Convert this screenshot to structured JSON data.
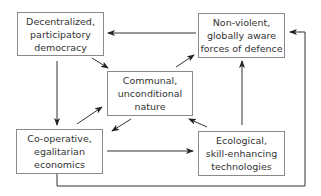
{
  "nodes": {
    "democracy": {
      "label": "Decentralized,\nparticipatory\ndemocracy"
    },
    "defence": {
      "label": "Non-violent,\nglobally aware\nforces of defence"
    },
    "nature": {
      "label": "Communal,\nunconditional\nnature"
    },
    "economics": {
      "label": "Co-operative,\negalitarian\neconomics"
    },
    "technologies": {
      "label": "Ecological,\nskill-enhancing\ntechnologies"
    }
  },
  "edges": [
    {
      "from": "defence",
      "to": "democracy"
    },
    {
      "from": "democracy",
      "to": "nature"
    },
    {
      "from": "nature",
      "to": "defence"
    },
    {
      "from": "democracy",
      "to": "economics"
    },
    {
      "from": "economics",
      "to": "nature"
    },
    {
      "from": "nature",
      "to": "economics"
    },
    {
      "from": "technologies",
      "to": "nature"
    },
    {
      "from": "economics",
      "to": "technologies"
    },
    {
      "from": "technologies",
      "to": "defence"
    },
    {
      "from": "economics",
      "to": "defence",
      "route": "bottom-right loop"
    }
  ],
  "colors": {
    "line": "#333333",
    "border": "#8a8a8a",
    "text": "#333333"
  }
}
